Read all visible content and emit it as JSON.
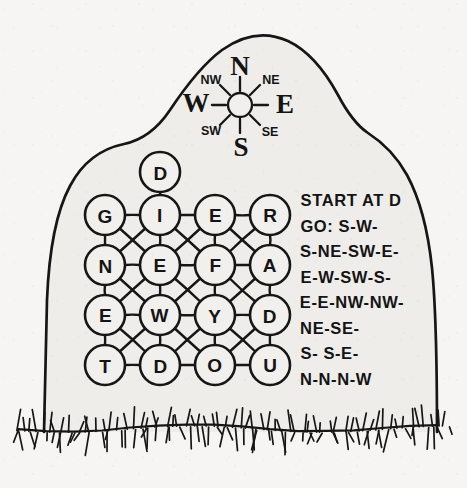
{
  "scene": {
    "title": "Tombstone letter-grid puzzle",
    "paper_color": "#f6f5f3",
    "stone_color": "#eeedea",
    "ink_color": "#161616"
  },
  "compass": {
    "name": "compass-rose",
    "center": {
      "x": 240,
      "y": 105
    },
    "hub_radius": 12,
    "ray_count": 8,
    "labels": [
      {
        "id": "north",
        "text": "N",
        "x": 240,
        "y": 66,
        "size": "major"
      },
      {
        "id": "south",
        "text": "S",
        "x": 241,
        "y": 147,
        "size": "major"
      },
      {
        "id": "east",
        "text": "E",
        "x": 285,
        "y": 104,
        "size": "major"
      },
      {
        "id": "west",
        "text": "W",
        "x": 196,
        "y": 103,
        "size": "major"
      },
      {
        "id": "northeast",
        "text": "NE",
        "x": 271,
        "y": 80,
        "size": "minor"
      },
      {
        "id": "northwest",
        "text": "NW",
        "x": 211,
        "y": 80,
        "size": "minor"
      },
      {
        "id": "southeast",
        "text": "SE",
        "x": 270,
        "y": 132,
        "size": "minor"
      },
      {
        "id": "southwest",
        "text": "SW",
        "x": 211,
        "y": 131,
        "size": "minor"
      }
    ]
  },
  "grid": {
    "name": "letter-grid",
    "radius": 20,
    "origin": {
      "x": 105,
      "y": 215
    },
    "spacing": {
      "x": 55,
      "y": 50
    },
    "rows": [
      [
        "G",
        "I",
        "E",
        "R"
      ],
      [
        "N",
        "E",
        "F",
        "A"
      ],
      [
        "E",
        "W",
        "Y",
        "D"
      ],
      [
        "T",
        "D",
        "O",
        "U"
      ]
    ],
    "start_node": {
      "letter": "D",
      "x": 160,
      "y": 172
    },
    "start_node_edge": {
      "x1": 160,
      "y1": 192,
      "x2": 160,
      "y2": 195
    }
  },
  "instructions": {
    "name": "route-instructions",
    "lines": [
      "START AT D",
      "GO: S-W-",
      "S-NE-SW-E-",
      "E-W-SW-S-",
      "E-E-NW-NW-",
      "NE-SE-",
      "S- S-E-",
      "N-N-N-W"
    ],
    "start_letter": "D",
    "x": 300,
    "y_first": 206,
    "line_height": 25.5
  },
  "ground": {
    "name": "grass-line",
    "baseline_y": 428,
    "blade_count": 64
  }
}
